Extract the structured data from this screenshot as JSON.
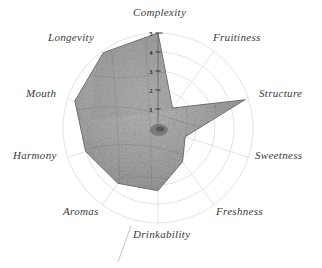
{
  "chart_data": {
    "type": "radar",
    "title": "",
    "categories": [
      "Complexity",
      "Fruitiness",
      "Structure",
      "Sweetness",
      "Freshness",
      "Drinkability",
      "Aromas",
      "Harmony",
      "Mouth",
      "Longevity"
    ],
    "values": [
      5.0,
      1.3,
      4.8,
      1.5,
      2.2,
      3.3,
      3.6,
      4.0,
      4.6,
      4.9
    ],
    "series": [
      {
        "name": "Tasting profile",
        "values": [
          5.0,
          1.3,
          4.8,
          1.5,
          2.2,
          3.3,
          3.6,
          4.0,
          4.6,
          4.9
        ]
      }
    ],
    "tick_labels": [
      "1",
      "2",
      "3",
      "4",
      "5"
    ],
    "rlim": [
      0,
      5
    ],
    "grid": true,
    "legend": "none",
    "xlabel": "",
    "ylabel": "",
    "fill_color": "#9a9a9a",
    "grid_color": "#d8d8d8",
    "label_color": "#3a3a3a"
  },
  "labels": {
    "complexity": "Complexity",
    "fruitiness": "Fruitiness",
    "structure": "Structure",
    "sweetness": "Sweetness",
    "freshness": "Freshness",
    "drinkability": "Drinkability",
    "aromas": "Aromas",
    "harmony": "Harmony",
    "mouth": "Mouth",
    "longevity": "Longevity"
  },
  "ticks": {
    "t1": "1",
    "t2": "2",
    "t3": "3",
    "t4": "4",
    "t5": "5"
  }
}
